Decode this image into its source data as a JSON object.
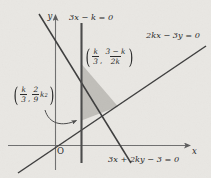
{
  "figure": {
    "background_color": "#e9e7e3",
    "line_color": "#3a3a3a",
    "axis_color": "#6d6d6d",
    "shade_color": "#b9b7b3",
    "axes": {
      "y_label": "y",
      "x_label": "x",
      "origin_label": "O"
    },
    "line_labels": {
      "vertical_line": "3x − k = 0",
      "through_origin_line": "2kx − 3y = 0",
      "negative_slope_line": "3x + 2ky − 3 = 0"
    },
    "points": {
      "upper_vertex": {
        "x_num": "k",
        "x_den": "3",
        "y_num": "3 − k",
        "y_den": "2k",
        "text": "(k/3, (3−k)/(2k))"
      },
      "lower_vertex": {
        "x_num": "k",
        "x_den": "3",
        "y_coef_num": "2",
        "y_coef_den": "9",
        "y_var": "k",
        "y_exp": "2",
        "text": "(k/3, (2/9)k²)"
      }
    }
  }
}
